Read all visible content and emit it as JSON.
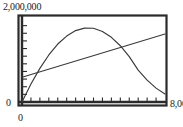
{
  "chart_data": {
    "type": "line",
    "title": "",
    "xlabel": "",
    "ylabel": "",
    "xlim": [
      0,
      8000
    ],
    "ylim": [
      0,
      2000000
    ],
    "grid": false,
    "legend": "none",
    "x_tick_labels": [
      "0",
      "8,000"
    ],
    "y_tick_labels": [
      "0",
      "2,000,000"
    ],
    "x_tick_count": 16,
    "y_tick_count": 11,
    "axis_color": "#1a1a1a",
    "curve_color": "#3a3a3a",
    "frame_style": "calculator-window-thick-border",
    "series": [
      {
        "name": "parabola",
        "shape": "downward-parabola",
        "x": [
          0,
          500,
          1000,
          1500,
          2000,
          2500,
          3000,
          3500,
          4000,
          4500,
          5000,
          5500,
          6000,
          6500,
          7000,
          7500,
          8000
        ],
        "y": [
          0,
          430000,
          800000,
          1120000,
          1380000,
          1570000,
          1700000,
          1760000,
          1755000,
          1680000,
          1540000,
          1340000,
          1080000,
          760000,
          520000,
          330000,
          190000
        ]
      },
      {
        "name": "line",
        "shape": "straight-line",
        "x": [
          0,
          8000
        ],
        "y": [
          590000,
          1620000
        ]
      }
    ],
    "intersection_approx": {
      "x": 5100,
      "y": 1240000
    },
    "peak_approx": {
      "x": 3200,
      "y": 1770000
    }
  },
  "labels": {
    "y_max": "2,000,000",
    "y_zero": "0",
    "x_zero": "0",
    "x_max": "8,000"
  }
}
